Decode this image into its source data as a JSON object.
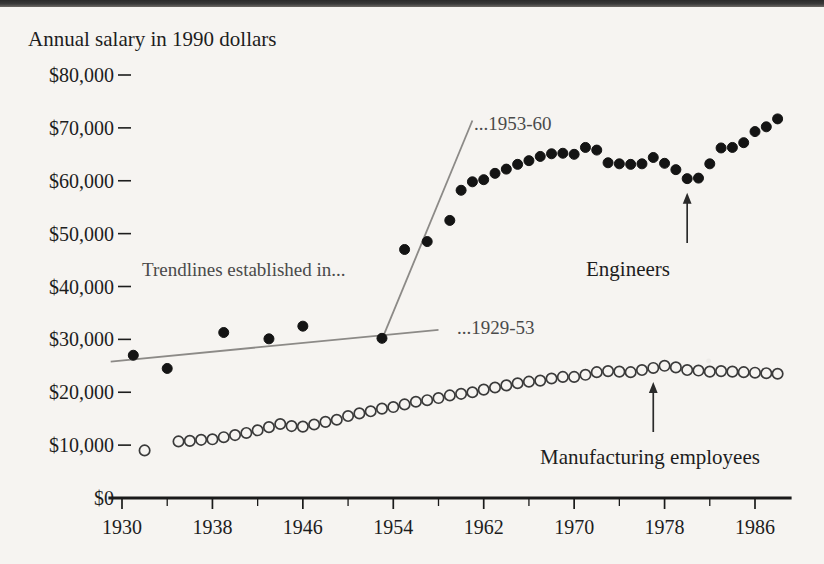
{
  "figure": {
    "axis_title": "Annual salary in 1990 dollars",
    "top_border_color": "#2b2b2b",
    "background_color": "#f6f4f1",
    "ink_color": "#1d1d1d",
    "trend_color": "#8c8a87"
  },
  "annotations": {
    "trendlines_note": "Trendlines established in...",
    "trend_early_label": "...1929-53",
    "trend_late_label": "...1953-60",
    "engineers_label": "Engineers",
    "manufacturing_label": "Manufacturing employees"
  },
  "chart_data": {
    "type": "scatter",
    "title": "",
    "subtitle": "",
    "xlabel": "",
    "ylabel": "Annual salary in 1990 dollars",
    "xlim": [
      1929,
      1990
    ],
    "ylim": [
      0,
      80000
    ],
    "grid": false,
    "legend_position": "inline-annotations",
    "y_ticks": [
      0,
      10000,
      20000,
      30000,
      40000,
      50000,
      60000,
      70000,
      80000
    ],
    "y_tick_labels": [
      "$0",
      "$10,000",
      "$20,000",
      "$30,000",
      "$40,000",
      "$50,000",
      "$60,000",
      "$70,000",
      "$80,000"
    ],
    "x_ticks_major": [
      1930,
      1938,
      1946,
      1954,
      1962,
      1970,
      1978,
      1986
    ],
    "x_tick_labels": [
      "1930",
      "1938",
      "1946",
      "1954",
      "1962",
      "1970",
      "1978",
      "1986"
    ],
    "x_ticks_minor": [
      1934,
      1942,
      1950,
      1958,
      1966,
      1974,
      1982
    ],
    "series": [
      {
        "name": "Engineers",
        "marker": "filled-circle",
        "marker_color": "#141414",
        "points": [
          [
            1931,
            27000
          ],
          [
            1934,
            24500
          ],
          [
            1939,
            31300
          ],
          [
            1943,
            30100
          ],
          [
            1946,
            32500
          ],
          [
            1953,
            30200
          ],
          [
            1955,
            47000
          ],
          [
            1957,
            48500
          ],
          [
            1959,
            52500
          ],
          [
            1960,
            58200
          ],
          [
            1961,
            59800
          ],
          [
            1962,
            60200
          ],
          [
            1963,
            61400
          ],
          [
            1964,
            62200
          ],
          [
            1965,
            63100
          ],
          [
            1966,
            63800
          ],
          [
            1967,
            64600
          ],
          [
            1968,
            65100
          ],
          [
            1969,
            65200
          ],
          [
            1970,
            65000
          ],
          [
            1971,
            66300
          ],
          [
            1972,
            65800
          ],
          [
            1973,
            63400
          ],
          [
            1974,
            63200
          ],
          [
            1975,
            63100
          ],
          [
            1976,
            63200
          ],
          [
            1977,
            64400
          ],
          [
            1978,
            63300
          ],
          [
            1979,
            62100
          ],
          [
            1980,
            60400
          ],
          [
            1981,
            60500
          ],
          [
            1982,
            63200
          ],
          [
            1983,
            66200
          ],
          [
            1984,
            66300
          ],
          [
            1985,
            67200
          ],
          [
            1986,
            69300
          ],
          [
            1987,
            70200
          ],
          [
            1988,
            71700
          ]
        ]
      },
      {
        "name": "Manufacturing employees",
        "marker": "open-circle",
        "marker_color": "#3a3a3a",
        "points": [
          [
            1932,
            9000
          ],
          [
            1935,
            10700
          ],
          [
            1936,
            10800
          ],
          [
            1937,
            11000
          ],
          [
            1938,
            11100
          ],
          [
            1939,
            11500
          ],
          [
            1940,
            11900
          ],
          [
            1941,
            12300
          ],
          [
            1942,
            12800
          ],
          [
            1943,
            13400
          ],
          [
            1944,
            14000
          ],
          [
            1945,
            13600
          ],
          [
            1946,
            13500
          ],
          [
            1947,
            13900
          ],
          [
            1948,
            14400
          ],
          [
            1949,
            14800
          ],
          [
            1950,
            15500
          ],
          [
            1951,
            16000
          ],
          [
            1952,
            16400
          ],
          [
            1953,
            16900
          ],
          [
            1954,
            17200
          ],
          [
            1955,
            17700
          ],
          [
            1956,
            18200
          ],
          [
            1957,
            18500
          ],
          [
            1958,
            18900
          ],
          [
            1959,
            19400
          ],
          [
            1960,
            19700
          ],
          [
            1961,
            20000
          ],
          [
            1962,
            20500
          ],
          [
            1963,
            20900
          ],
          [
            1964,
            21300
          ],
          [
            1965,
            21700
          ],
          [
            1966,
            22000
          ],
          [
            1967,
            22200
          ],
          [
            1968,
            22600
          ],
          [
            1969,
            22900
          ],
          [
            1970,
            22900
          ],
          [
            1971,
            23300
          ],
          [
            1972,
            23800
          ],
          [
            1973,
            24000
          ],
          [
            1974,
            23900
          ],
          [
            1975,
            23800
          ],
          [
            1976,
            24200
          ],
          [
            1977,
            24600
          ],
          [
            1978,
            25000
          ],
          [
            1979,
            24700
          ],
          [
            1980,
            24200
          ],
          [
            1981,
            24100
          ],
          [
            1982,
            23900
          ],
          [
            1983,
            24000
          ],
          [
            1984,
            23900
          ],
          [
            1985,
            23800
          ],
          [
            1986,
            23700
          ],
          [
            1987,
            23600
          ],
          [
            1988,
            23500
          ]
        ]
      }
    ],
    "trendlines": [
      {
        "name": "...1929-53",
        "from": [
          1929,
          25800
        ],
        "to": [
          1958,
          31800
        ]
      },
      {
        "name": "...1953-60",
        "from": [
          1953,
          30000
        ],
        "to": [
          1961,
          71400
        ]
      }
    ],
    "arrows": [
      {
        "label": "Engineers",
        "points_to": [
          1980,
          60400
        ]
      },
      {
        "label": "Manufacturing employees",
        "points_to": [
          1977,
          24600
        ]
      }
    ]
  }
}
